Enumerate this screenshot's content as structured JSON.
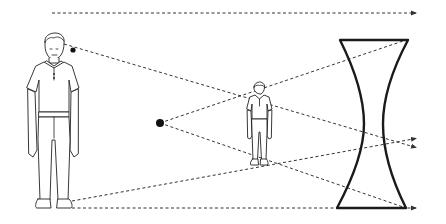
{
  "diagram": {
    "title": "Diverging (concave) lens forming a reduced virtual image",
    "elements": {
      "object_person": {
        "label": "object (person)",
        "x": 42,
        "top": 38,
        "bottom": 212
      },
      "image_person": {
        "label": "virtual image (smaller person)",
        "x": 259,
        "top": 82,
        "bottom": 167
      },
      "focal_point": {
        "label": "focal point",
        "x": 160,
        "y": 123
      },
      "small_dot": {
        "label": "marker dot",
        "x": 73,
        "y": 50
      },
      "lens": {
        "label": "concave lens",
        "type": "biconcave"
      }
    },
    "rays": [
      {
        "name": "top-parallel-ray",
        "from": [
          52,
          13
        ],
        "to": [
          418,
          13
        ]
      },
      {
        "name": "head-ray",
        "from": [
          64,
          44
        ],
        "to": [
          418,
          148
        ]
      },
      {
        "name": "focal-ray-up",
        "from": [
          160,
          123
        ],
        "to": [
          405,
          40
        ]
      },
      {
        "name": "focal-ray-down",
        "from": [
          160,
          123
        ],
        "to": [
          406,
          208
        ]
      },
      {
        "name": "feet-ray-up",
        "from": [
          72,
          200
        ],
        "to": [
          418,
          138
        ]
      },
      {
        "name": "bottom-parallel-ray",
        "from": [
          72,
          208
        ],
        "to": [
          418,
          208
        ]
      }
    ],
    "colors": {
      "line": "#333333",
      "lens": "#1a1a1a",
      "background": "#ffffff"
    }
  }
}
